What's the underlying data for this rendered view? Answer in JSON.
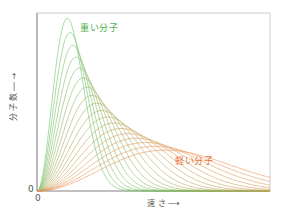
{
  "chart_data": {
    "type": "line",
    "title": "",
    "xlabel": "速 さ",
    "ylabel": "分子数",
    "x_origin_label": "0",
    "y_origin_label": "0",
    "grid": false,
    "legend": "inline annotations",
    "annotations": [
      {
        "text": "重い分子",
        "color": "#4caf50",
        "position": "near tall peak"
      },
      {
        "text": "軽い分子",
        "color": "#e8733a",
        "position": "near long tail"
      }
    ],
    "series_count": 18,
    "series": [
      {
        "name": "重い分子",
        "peak_speed_frac": 0.13,
        "peak_height_frac": 0.97,
        "color": "#6cc46c"
      },
      {
        "name": "軽い分子",
        "peak_speed_frac": 0.55,
        "peak_height_frac": 0.23,
        "color": "#f09050"
      }
    ],
    "xlim": [
      0,
      1
    ],
    "ylim": [
      0,
      1
    ]
  },
  "labels": {
    "heavy": "重い分子",
    "light": "軽い分子",
    "ylabel_text": "分子数",
    "ylabel_arrow": "→",
    "xlabel_text": "速 さ",
    "xlabel_arrow": "⟶",
    "zero_x": "0",
    "zero_y": "0"
  },
  "frame": {
    "left": 37,
    "top": 13,
    "right": 270,
    "bottom": 191,
    "axis_color": "#999999",
    "frame_color": "#cccccc"
  }
}
